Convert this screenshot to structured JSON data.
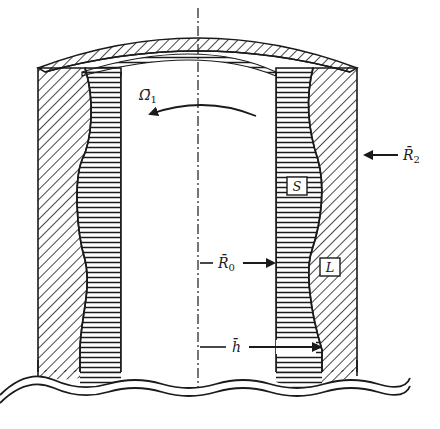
{
  "diagram": {
    "type": "cross-section schematic",
    "colors": {
      "ink": "#1a1a1a",
      "background": "#ffffff"
    },
    "labels": {
      "omega": "Ω̄",
      "omega_sub": "1",
      "r2": "R̄",
      "r2_sub": "2",
      "r0": "R̄",
      "r0_sub": "0",
      "h": "h̄",
      "solid": "S",
      "liquid": "L"
    },
    "regions": [
      {
        "name": "solid-region",
        "label": "S",
        "hatch": "horizontal"
      },
      {
        "name": "liquid-region",
        "label": "L",
        "hatch": "diagonal"
      }
    ],
    "annotations": [
      {
        "name": "rotation-arrow",
        "label": "Ω̄1",
        "direction": "counter-clockwise"
      },
      {
        "name": "outer-radius-arrow",
        "label": "R̄2",
        "direction": "inward"
      },
      {
        "name": "inner-radius-arrow",
        "label": "R̄0",
        "direction": "outward"
      },
      {
        "name": "thickness-arrow",
        "label": "h̄",
        "direction": "outward"
      }
    ]
  }
}
